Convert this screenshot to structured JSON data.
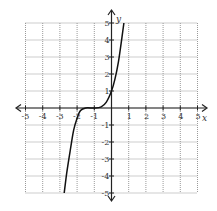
{
  "chart_data": {
    "type": "line",
    "title": "",
    "xlabel": "x",
    "ylabel": "y",
    "xlim": [
      -5,
      5
    ],
    "ylim": [
      -5,
      5
    ],
    "grid": true,
    "x_ticks": [
      -5,
      -4,
      -3,
      -2,
      -1,
      1,
      2,
      3,
      4,
      5
    ],
    "y_ticks": [
      -5,
      -4,
      -3,
      -2,
      -1,
      1,
      2,
      3,
      4,
      5
    ],
    "series": [
      {
        "name": "f(x)",
        "x": [
          -2.75,
          -2.6,
          -2.4,
          -2.2,
          -2.0,
          -1.8,
          -1.5,
          -1.0,
          -0.6,
          -0.3,
          0.0,
          0.2,
          0.4,
          0.6,
          0.72
        ],
        "y": [
          -5.0,
          -3.8,
          -2.5,
          -1.3,
          -0.6,
          -0.15,
          0.0,
          0.0,
          0.07,
          0.35,
          1.0,
          1.7,
          2.7,
          4.1,
          5.0
        ]
      }
    ],
    "style": {
      "curve_color": "#111111",
      "grid_color": "#9a9a9a",
      "axis_color": "#222222"
    }
  },
  "labels": {
    "x_axis": "x",
    "y_axis": "y"
  }
}
